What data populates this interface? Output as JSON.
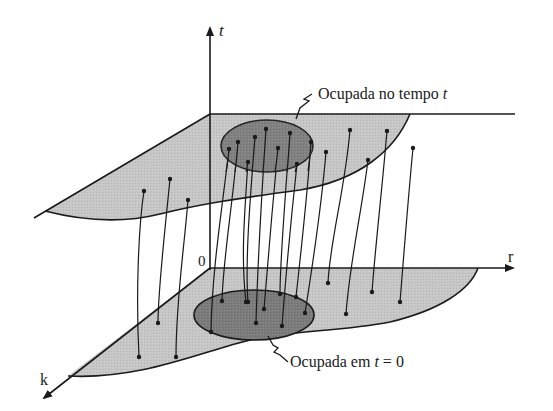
{
  "diagram": {
    "type": "3d-flow-map",
    "axes": {
      "vertical": "t",
      "horizontal": "r",
      "depth": "k",
      "origin": "0"
    },
    "labels": {
      "top_region_prefix": "Ocupada no tempo ",
      "top_region_var": "t",
      "bottom_region_prefix": "Ocupada em ",
      "bottom_region_var": "t",
      "bottom_region_suffix": " = 0"
    },
    "planes": [
      {
        "name": "plane-at-time-t",
        "fill": "#c4c4c4",
        "stroke": "#1a1a1a"
      },
      {
        "name": "plane-at-time-0",
        "fill": "#c4c4c4",
        "stroke": "#1a1a1a"
      }
    ],
    "regions": [
      {
        "name": "occupied-region-time-t",
        "fill": "#7a7a7a"
      },
      {
        "name": "occupied-region-time-0",
        "fill": "#7a7a7a"
      }
    ],
    "trajectory_count": 20
  }
}
